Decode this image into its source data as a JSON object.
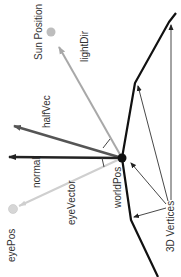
{
  "diagram": {
    "type": "lighting-vectors",
    "labels": {
      "sun_position": "Sun Position",
      "light_dir": "lightDir",
      "half_vec": "halfVec",
      "normal": "normal",
      "eye_vector": "eyeVector",
      "world_pos": "worldPos",
      "eye_pos": "eyePos",
      "vertices": "3D Vertices"
    },
    "colors": {
      "surface": "#111111",
      "light_dir": "#a8a8a8",
      "half_vec": "#555555",
      "normal": "#222222",
      "eye_vector": "#cfcfcf",
      "sun": "#bdbdbd",
      "eye": "#d6d6d6",
      "text": "#333333"
    }
  }
}
